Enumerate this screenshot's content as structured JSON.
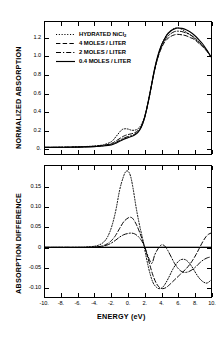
{
  "chart_data": {
    "type": "line",
    "title": "",
    "xlabel": "ENERGY  (eV)",
    "xlim": [
      -10,
      10
    ],
    "xticks": [
      "-10.",
      "-8.",
      "-6.",
      "-4.",
      "-2.",
      "0.",
      "2.",
      "4.",
      "6.",
      "8.",
      "10."
    ],
    "xtick_values": [
      -10,
      -8,
      -6,
      -4,
      -2,
      0,
      2,
      4,
      6,
      8,
      10
    ],
    "grid": false,
    "legend_position": "upper-left-inside-top-panel",
    "panels": [
      {
        "name": "normalized-absorption",
        "ylabel": "NORMALIZED ABSORPTION",
        "ylim": [
          -0.06,
          1.38
        ],
        "yticks": [
          "0.",
          "0.2",
          "0.4",
          "0.6",
          "0.8",
          "1.0",
          "1.2"
        ],
        "ytick_values": [
          0,
          0.2,
          0.4,
          0.6,
          0.8,
          1.0,
          1.2
        ],
        "series": [
          {
            "name": "HYDRATED NiCl2",
            "style": "dotted",
            "x": [
              -10,
              -9,
              -8,
              -7,
              -6,
              -5,
              -4,
              -3,
              -2,
              -1.4,
              -0.8,
              -0.4,
              0,
              0.4,
              0.8,
              1.2,
              1.6,
              2,
              2.4,
              2.8,
              3.2,
              3.6,
              4,
              4.4,
              4.8,
              5.2,
              5.6,
              6,
              6.5,
              7,
              7.5,
              8,
              8.5,
              9,
              9.5,
              10
            ],
            "y": [
              0.012,
              0.013,
              0.014,
              0.016,
              0.018,
              0.022,
              0.028,
              0.04,
              0.075,
              0.135,
              0.2,
              0.215,
              0.212,
              0.2,
              0.2,
              0.215,
              0.26,
              0.35,
              0.5,
              0.68,
              0.86,
              1.0,
              1.12,
              1.2,
              1.26,
              1.29,
              1.31,
              1.315,
              1.3,
              1.27,
              1.24,
              1.2,
              1.16,
              1.12,
              1.07,
              1.0
            ]
          },
          {
            "name": "4 MOLES / LITER",
            "style": "dashed",
            "x": [
              -10,
              -9,
              -8,
              -7,
              -6,
              -5,
              -4,
              -3,
              -2,
              -1.4,
              -0.8,
              -0.4,
              0,
              0.4,
              0.8,
              1.2,
              1.6,
              2,
              2.4,
              2.8,
              3.2,
              3.6,
              4,
              4.4,
              4.8,
              5.2,
              5.6,
              6,
              6.5,
              7,
              7.5,
              8,
              8.5,
              9,
              9.5,
              10
            ],
            "y": [
              0.012,
              0.013,
              0.014,
              0.015,
              0.017,
              0.02,
              0.025,
              0.034,
              0.055,
              0.085,
              0.12,
              0.14,
              0.152,
              0.16,
              0.172,
              0.195,
              0.245,
              0.34,
              0.49,
              0.67,
              0.85,
              0.99,
              1.09,
              1.16,
              1.2,
              1.225,
              1.24,
              1.245,
              1.24,
              1.23,
              1.21,
              1.19,
              1.15,
              1.11,
              1.06,
              1.0
            ]
          },
          {
            "name": "2 MOLES / LITER",
            "style": "dashdot",
            "x": [
              -10,
              -9,
              -8,
              -7,
              -6,
              -5,
              -4,
              -3,
              -2,
              -1.4,
              -0.8,
              -0.4,
              0,
              0.4,
              0.8,
              1.2,
              1.6,
              2,
              2.4,
              2.8,
              3.2,
              3.6,
              4,
              4.4,
              4.8,
              5.2,
              5.6,
              6,
              6.5,
              7,
              7.5,
              8,
              8.5,
              9,
              9.5,
              10
            ],
            "y": [
              0.012,
              0.012,
              0.013,
              0.014,
              0.016,
              0.019,
              0.023,
              0.03,
              0.046,
              0.07,
              0.1,
              0.118,
              0.13,
              0.14,
              0.155,
              0.182,
              0.235,
              0.335,
              0.49,
              0.67,
              0.855,
              1.0,
              1.1,
              1.175,
              1.225,
              1.255,
              1.275,
              1.28,
              1.275,
              1.26,
              1.24,
              1.21,
              1.17,
              1.12,
              1.07,
              1.0
            ]
          },
          {
            "name": "0.4 MOLES / LITER",
            "style": "solid",
            "x": [
              -10,
              -9,
              -8,
              -7,
              -6,
              -5,
              -4,
              -3,
              -2,
              -1.4,
              -0.8,
              -0.4,
              0,
              0.4,
              0.8,
              1.2,
              1.6,
              2,
              2.4,
              2.8,
              3.2,
              3.6,
              4,
              4.4,
              4.8,
              5.2,
              5.6,
              6,
              6.5,
              7,
              7.5,
              8,
              8.5,
              9,
              9.5,
              10
            ],
            "y": [
              0.012,
              0.012,
              0.013,
              0.014,
              0.015,
              0.017,
              0.021,
              0.027,
              0.04,
              0.06,
              0.088,
              0.105,
              0.118,
              0.13,
              0.148,
              0.177,
              0.232,
              0.335,
              0.492,
              0.678,
              0.868,
              1.015,
              1.12,
              1.195,
              1.25,
              1.285,
              1.305,
              1.315,
              1.31,
              1.295,
              1.27,
              1.235,
              1.19,
              1.14,
              1.075,
              1.0
            ]
          }
        ]
      },
      {
        "name": "absorption-difference",
        "ylabel": "ABSORPTION DIFFERENCE",
        "ylim": [
          -0.125,
          0.205
        ],
        "yticks": [
          "0.15",
          "0.10",
          "0.05",
          "0",
          "-0.05",
          "-0.10"
        ],
        "ytick_values": [
          0.15,
          0.1,
          0.05,
          0,
          -0.05,
          -0.1
        ],
        "zero_line": 0,
        "series": [
          {
            "name": "HYDRATED NiCl2",
            "style": "dotted",
            "x": [
              -10,
              -8,
              -6,
              -5,
              -4,
              -3.5,
              -3,
              -2.5,
              -2,
              -1.5,
              -1,
              -0.6,
              -0.3,
              0,
              0.3,
              0.6,
              1,
              1.4,
              1.8,
              2.2,
              2.6,
              3,
              3.4,
              3.8,
              4.2,
              4.6,
              5,
              5.4,
              5.8,
              6.2,
              6.6,
              7,
              7.4,
              7.8,
              8.2,
              8.6,
              9,
              9.4,
              9.7,
              10
            ],
            "y": [
              0,
              0,
              0,
              0.001,
              0.003,
              0.006,
              0.012,
              0.025,
              0.05,
              0.09,
              0.145,
              0.175,
              0.19,
              0.192,
              0.18,
              0.15,
              0.098,
              0.055,
              0.018,
              -0.025,
              -0.062,
              -0.088,
              -0.1,
              -0.104,
              -0.1,
              -0.088,
              -0.072,
              -0.055,
              -0.042,
              -0.033,
              -0.03,
              -0.032,
              -0.04,
              -0.052,
              -0.066,
              -0.078,
              -0.086,
              -0.09,
              -0.088,
              -0.082
            ]
          },
          {
            "name": "4 MOLES / LITER",
            "style": "dashed",
            "x": [
              -10,
              -8,
              -6,
              -5,
              -4,
              -3.5,
              -3,
              -2.5,
              -2,
              -1.5,
              -1,
              -0.5,
              0,
              0.3,
              0.6,
              1,
              1.4,
              1.8,
              2.2,
              2.6,
              3,
              3.4,
              3.8,
              4.2,
              4.6,
              5,
              5.4,
              5.8,
              6.2,
              6.6,
              7,
              7.4,
              7.8,
              8.2,
              8.6,
              9,
              9.4,
              9.7,
              10
            ],
            "y": [
              0,
              0,
              0,
              0,
              0.001,
              0.002,
              0.004,
              0.009,
              0.017,
              0.03,
              0.048,
              0.065,
              0.074,
              0.076,
              0.072,
              0.058,
              0.038,
              0.015,
              -0.012,
              -0.042,
              -0.07,
              -0.09,
              -0.101,
              -0.104,
              -0.101,
              -0.094,
              -0.086,
              -0.078,
              -0.07,
              -0.062,
              -0.054,
              -0.044,
              -0.032,
              -0.018,
              -0.002,
              0.014,
              0.027,
              0.033,
              0.036
            ]
          },
          {
            "name": "2 MOLES / LITER",
            "style": "dashdot",
            "x": [
              -10,
              -8,
              -6,
              -5,
              -4,
              -3.5,
              -3,
              -2.5,
              -2,
              -1.5,
              -1,
              -0.5,
              0,
              0.4,
              0.8,
              1.2,
              1.6,
              2,
              2.4,
              2.8,
              3,
              3.2,
              3.6,
              4,
              4.4,
              4.8,
              5.2,
              5.6,
              6,
              6.4,
              6.8,
              7.2,
              7.6,
              8,
              8.4,
              8.8,
              9.2,
              9.6,
              10
            ],
            "y": [
              0,
              0,
              0,
              0,
              0.001,
              0.002,
              0.003,
              0.006,
              0.011,
              0.018,
              0.026,
              0.032,
              0.035,
              0.036,
              0.034,
              0.028,
              0.018,
              0.002,
              -0.022,
              -0.04,
              -0.035,
              -0.02,
              -0.004,
              0.006,
              0.004,
              -0.008,
              -0.024,
              -0.04,
              -0.052,
              -0.06,
              -0.063,
              -0.062,
              -0.058,
              -0.052,
              -0.044,
              -0.036,
              -0.03,
              -0.026,
              -0.024
            ]
          },
          {
            "name": "0.4 MOLES / LITER",
            "style": "solid",
            "x": [
              -10,
              -6,
              -3,
              -1,
              0,
              1,
              2,
              3,
              4,
              5,
              6,
              7,
              8,
              9,
              10
            ],
            "y": [
              0,
              0,
              0,
              0,
              0,
              0,
              0,
              0,
              0,
              0,
              0,
              0,
              0,
              0,
              0
            ]
          }
        ]
      }
    ]
  },
  "legend": {
    "items": [
      {
        "label": "HYDRATED NiCl",
        "sub": "2",
        "style": "dotted"
      },
      {
        "label": "4 MOLES / LITER",
        "sub": "",
        "style": "dashed"
      },
      {
        "label": "2 MOLES / LITER",
        "sub": "",
        "style": "dashdot"
      },
      {
        "label": "0.4 MOLES / LITER",
        "sub": "",
        "style": "solid"
      }
    ]
  },
  "colors": {
    "ink": "#000000",
    "background": "#ffffff"
  }
}
